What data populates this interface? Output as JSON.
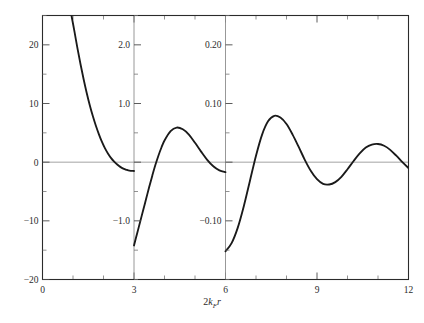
{
  "figure": {
    "background": "#ffffff",
    "curve_color": "#1a1a1a",
    "frame_color": "#2b2b2b",
    "guide_color": "#8c8c8c"
  },
  "axis_title": {
    "prefix": "2",
    "k": "k",
    "sub": "F",
    "r": "r",
    "full": "2k_F r"
  },
  "xaxis": {
    "label": "2k_F r",
    "min": 0,
    "max": 12,
    "major_ticks": [
      0,
      3,
      6,
      9,
      12
    ],
    "major_tick_labels": [
      "0",
      "3",
      "6",
      "9",
      "12"
    ],
    "minor_tick_step": 1
  },
  "panels": [
    {
      "name": "panel-left",
      "x_range": [
        0,
        3
      ],
      "y_min": -20,
      "y_max": 25,
      "major_ticks": [
        -20,
        -10,
        0,
        10,
        20
      ],
      "tick_labels": [
        "−20",
        "−10",
        "0",
        "10",
        "20"
      ],
      "minor_tick_step": 5
    },
    {
      "name": "panel-middle",
      "x_range": [
        3,
        6
      ],
      "y_min": -2.0,
      "y_max": 2.5,
      "major_ticks": [
        -1.0,
        0,
        1.0,
        2.0
      ],
      "tick_labels": [
        "−1.0",
        "",
        "1.0",
        "2.0"
      ],
      "minor_tick_step": 0.5
    },
    {
      "name": "panel-right",
      "x_range": [
        6,
        12
      ],
      "y_min": -0.2,
      "y_max": 0.25,
      "major_ticks": [
        -0.1,
        0,
        0.1,
        0.2
      ],
      "tick_labels": [
        "−0.10",
        "",
        "0.10",
        "0.20"
      ],
      "minor_tick_step": 0.05
    }
  ],
  "chart_data": {
    "type": "line",
    "title": "",
    "subtitle": "",
    "xlabel": "2k_F r",
    "ylabel": "",
    "xlim": [
      0,
      12
    ],
    "grid": false,
    "legend": null,
    "panel_count": 3,
    "note": "Friedel / RKKY-type damped oscillation plotted in three panels, each rescaled by roughly a factor of 10 in the vertical axis (±20, ±2.0, ±0.20).",
    "series": [
      {
        "name": "F(2k_F r)",
        "panel": "panel-left",
        "xlim": [
          0,
          3
        ],
        "ylim": [
          -20,
          25
        ],
        "x": [
          0.95,
          1.05,
          1.15,
          1.25,
          1.35,
          1.45,
          1.55,
          1.65,
          1.75,
          1.85,
          1.95,
          2.05,
          2.15,
          2.25,
          2.35,
          2.45,
          2.55,
          2.65,
          2.75,
          2.85,
          3.0
        ],
        "y": [
          25.0,
          22.2,
          19.3,
          16.6,
          14.1,
          11.8,
          9.7,
          7.85,
          6.2,
          4.75,
          3.45,
          2.35,
          1.45,
          0.7,
          0.1,
          -0.4,
          -0.8,
          -1.1,
          -1.3,
          -1.45,
          -1.5
        ]
      },
      {
        "name": "F(2k_F r)",
        "panel": "panel-middle",
        "xlim": [
          3,
          6
        ],
        "ylim": [
          -2.0,
          2.5
        ],
        "x": [
          3.0,
          3.1,
          3.2,
          3.3,
          3.4,
          3.5,
          3.6,
          3.7,
          3.8,
          3.9,
          4.0,
          4.2,
          4.4,
          4.6,
          4.8,
          5.0,
          5.2,
          5.4,
          5.6,
          5.8,
          6.0
        ],
        "y": [
          -1.42,
          -1.22,
          -1.02,
          -0.82,
          -0.62,
          -0.42,
          -0.23,
          -0.05,
          0.11,
          0.25,
          0.37,
          0.53,
          0.59,
          0.56,
          0.47,
          0.33,
          0.18,
          0.04,
          -0.07,
          -0.14,
          -0.17
        ]
      },
      {
        "name": "F(2k_F r)",
        "panel": "panel-right",
        "xlim": [
          6,
          12
        ],
        "ylim": [
          -0.2,
          0.25
        ],
        "x": [
          6.0,
          6.2,
          6.4,
          6.6,
          6.8,
          7.0,
          7.2,
          7.4,
          7.6,
          7.8,
          8.0,
          8.2,
          8.4,
          8.6,
          8.8,
          9.0,
          9.2,
          9.4,
          9.6,
          9.8,
          10.0,
          10.2,
          10.4,
          10.6,
          10.8,
          11.0,
          11.2,
          11.4,
          11.6,
          11.8,
          12.0
        ],
        "y": [
          -0.152,
          -0.138,
          -0.112,
          -0.075,
          -0.032,
          0.011,
          0.047,
          0.07,
          0.079,
          0.076,
          0.065,
          0.047,
          0.026,
          0.004,
          -0.015,
          -0.029,
          -0.037,
          -0.038,
          -0.034,
          -0.025,
          -0.012,
          0.002,
          0.015,
          0.025,
          0.03,
          0.031,
          0.028,
          0.021,
          0.011,
          0.0,
          -0.01
        ]
      }
    ]
  }
}
